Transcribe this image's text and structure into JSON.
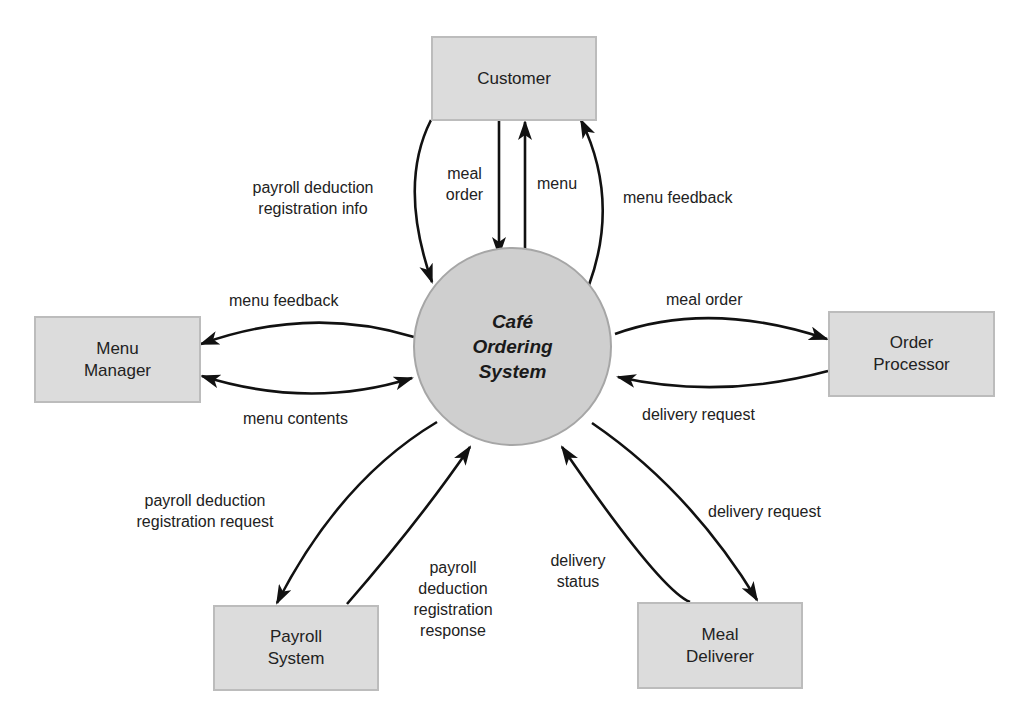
{
  "diagram": {
    "type": "context-diagram",
    "process": {
      "label": "Café\nOrdering\nSystem"
    },
    "entities": {
      "customer": {
        "label": "Customer"
      },
      "menu_manager": {
        "label": "Menu\nManager"
      },
      "order_processor": {
        "label": "Order\nProcessor"
      },
      "payroll_system": {
        "label": "Payroll\nSystem"
      },
      "meal_deliverer": {
        "label": "Meal\nDeliverer"
      }
    },
    "flows": {
      "customer_payroll_info": {
        "label": "payroll deduction\nregistration info",
        "from": "Customer",
        "to": "Café Ordering System"
      },
      "customer_meal_order": {
        "label": "meal\norder",
        "from": "Customer",
        "to": "Café Ordering System"
      },
      "system_menu": {
        "label": "menu",
        "from": "Café Ordering System",
        "to": "Customer"
      },
      "customer_menu_feedback": {
        "label": "menu feedback",
        "from": "Café Ordering System",
        "to": "Customer"
      },
      "mm_menu_feedback": {
        "label": "menu feedback",
        "from": "Café Ordering System",
        "to": "Menu Manager"
      },
      "mm_menu_contents": {
        "label": "menu contents",
        "from": "Menu Manager",
        "to": "Café Ordering System",
        "bidirectional": true
      },
      "op_meal_order": {
        "label": "meal order",
        "from": "Café Ordering System",
        "to": "Order Processor"
      },
      "op_delivery_request": {
        "label": "delivery request",
        "from": "Order Processor",
        "to": "Café Ordering System"
      },
      "ps_registration_request": {
        "label": "payroll deduction\nregistration request",
        "from": "Café Ordering System",
        "to": "Payroll System"
      },
      "ps_registration_response": {
        "label": "payroll\ndeduction\nregistration\nresponse",
        "from": "Payroll System",
        "to": "Café Ordering System"
      },
      "md_delivery_status": {
        "label": "delivery\nstatus",
        "from": "Meal Deliverer",
        "to": "Café Ordering System"
      },
      "md_delivery_request": {
        "label": "delivery request",
        "from": "Café Ordering System",
        "to": "Meal Deliverer"
      }
    },
    "colors": {
      "entity_fill": "#dcdcdc",
      "entity_border": "#bcbcbc",
      "process_fill": "#cfcfcf",
      "process_border": "#a6a6a6",
      "arrow": "#111111",
      "text": "#222222"
    }
  }
}
